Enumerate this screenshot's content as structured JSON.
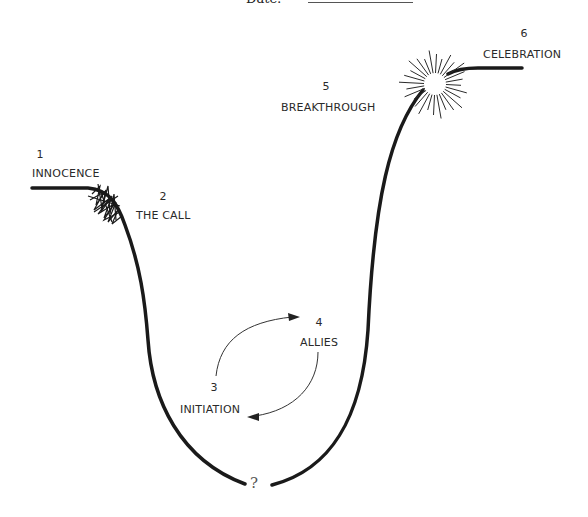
{
  "header": {
    "date_label": "Date:"
  },
  "stages": [
    {
      "number": "1",
      "label": "INNOCENCE"
    },
    {
      "number": "2",
      "label": "THE CALL"
    },
    {
      "number": "3",
      "label": "INITIATION"
    },
    {
      "number": "4",
      "label": "ALLIES"
    },
    {
      "number": "5",
      "label": "BREAKTHROUGH"
    },
    {
      "number": "6",
      "label": "CELEBRATION"
    }
  ],
  "bottom_marker": "?",
  "colors": {
    "line": "#1a1a1a",
    "text": "#2a2a2a",
    "background": "#ffffff"
  }
}
